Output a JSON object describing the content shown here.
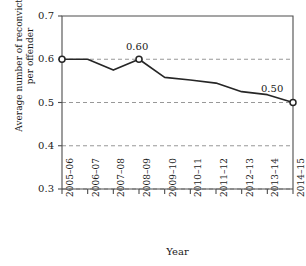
{
  "chart_data": {
    "type": "line",
    "title": "",
    "xlabel": "Year",
    "ylabel_line1": "Average number of reconvictions",
    "ylabel_line2": "per offender",
    "categories": [
      "2005–06",
      "2006–07",
      "2007–08",
      "2008–09",
      "2009–10",
      "2010–11",
      "2011–12",
      "2012–13",
      "2013–14",
      "2014–15"
    ],
    "values": [
      0.6,
      0.6,
      0.575,
      0.6,
      0.558,
      0.552,
      0.545,
      0.525,
      0.518,
      0.5
    ],
    "ylim": [
      0.3,
      0.7
    ],
    "yticks": [
      "0.3",
      "0.4",
      "0.5",
      "0.6",
      "0.7"
    ],
    "ytick_values": [
      0.3,
      0.4,
      0.5,
      0.6,
      0.7
    ],
    "grid": true,
    "grid_style": "dashed",
    "legend": "none",
    "line_color": "#262626",
    "marker_style": "open-circle",
    "markers_at": [
      0,
      9
    ],
    "annotations": [
      {
        "text": "0.60",
        "category": "2008–09",
        "value": 0.6
      },
      {
        "text": "0.50",
        "category": "2014–15",
        "value": 0.5
      }
    ]
  }
}
